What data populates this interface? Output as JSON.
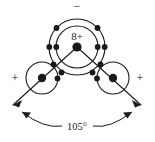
{
  "diagram": {
    "colors": {
      "stroke": "#1a1a1a",
      "electron": "#1a1a1a",
      "background": "#ffffff",
      "text": "#1a1a1a"
    },
    "nucleus": {
      "label": "8+",
      "name": "oxygen-nucleus"
    },
    "charges": {
      "top_negative": "−",
      "left_positive": "+",
      "right_positive": "+"
    },
    "hydrogen": {
      "left_label": "+",
      "right_label": "+"
    },
    "angle": {
      "value": "105°"
    },
    "shells": [
      {
        "name": "inner-shell",
        "r": 21
      },
      {
        "name": "outer-shell",
        "r": 28
      }
    ],
    "electrons": {
      "inner_count": 2,
      "outer_count": 8,
      "hydrogen_count": 2
    }
  }
}
